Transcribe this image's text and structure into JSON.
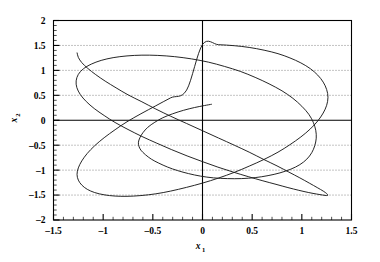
{
  "figure": {
    "background_color": "#ffffff",
    "frame_color": "#000000",
    "grid_color": "#555555",
    "curve_color": "#1a1a1a"
  },
  "axis_titles": {
    "x": "x",
    "x_sub": "1",
    "y": "x",
    "y_sub": "2"
  },
  "ticks": {
    "x_labels": [
      "-1.5",
      "-1",
      "-0.5",
      "0",
      "0.5",
      "1",
      "1.5"
    ],
    "y_labels": [
      "2",
      "1.5",
      "1",
      "0.5",
      "0",
      "-0.5",
      "-1",
      "-1.5",
      "-2"
    ]
  },
  "chart_data": {
    "type": "line",
    "title": "",
    "subtitle": "",
    "xlabel": "x1",
    "ylabel": "x2",
    "xlim": [
      -1.5,
      1.5
    ],
    "ylim": [
      -2,
      2
    ],
    "xticks": [
      -1.5,
      -1,
      -0.5,
      0,
      0.5,
      1,
      1.5
    ],
    "yticks": [
      -2,
      -1.5,
      -1,
      -0.5,
      0,
      0.5,
      1,
      1.5,
      2
    ],
    "x_minor_tick_step": 0.1,
    "y_minor_tick_step": 0.1,
    "grid": true,
    "grid_style": "dotted",
    "grid_axes": "y",
    "legend": null,
    "legend_position": "none",
    "annotations": [],
    "series": [
      {
        "name": "trajectory",
        "x": [
          0.09,
          0.02,
          -0.08,
          -0.19,
          -0.3,
          -0.4,
          -0.48,
          -0.55,
          -0.6,
          -0.63,
          -0.645,
          -0.64,
          -0.62,
          -0.575,
          -0.515,
          -0.44,
          -0.35,
          -0.25,
          -0.14,
          -0.02,
          0.11,
          0.25,
          0.39,
          0.53,
          0.66,
          0.78,
          0.89,
          0.98,
          1.05,
          1.1,
          1.13,
          1.145,
          1.14,
          1.115,
          1.07,
          1.0,
          0.91,
          0.8,
          0.67,
          0.53,
          0.38,
          0.22,
          0.06,
          -0.11,
          -0.28,
          -0.45,
          -0.61,
          -0.76,
          -0.9,
          -1.02,
          -1.12,
          -1.2,
          -1.25,
          -1.272,
          -1.265,
          -1.23,
          -1.17,
          -1.09,
          -0.99,
          -0.88,
          -0.75,
          -0.61,
          -0.46,
          -0.31,
          -0.155,
          0.0,
          0.155,
          0.31,
          0.46,
          0.6,
          0.74,
          0.86,
          0.97,
          1.07,
          1.15,
          1.21,
          1.25,
          1.262,
          1.25,
          1.215,
          1.155,
          1.075,
          0.98,
          0.87,
          0.75,
          0.61,
          0.47,
          0.32,
          0.16,
          0.0,
          -0.16,
          -0.32,
          -0.47,
          -0.61,
          -0.75,
          -0.87,
          -0.98,
          -1.075,
          -1.155,
          -1.215,
          -1.25,
          -1.262
        ],
        "y": [
          0.32,
          0.295,
          0.255,
          0.2,
          0.13,
          0.05,
          -0.04,
          -0.14,
          -0.25,
          -0.35,
          -0.44,
          -0.52,
          -0.6,
          -0.69,
          -0.78,
          -0.86,
          -0.94,
          -1.01,
          -1.07,
          -1.12,
          -1.155,
          -1.17,
          -1.17,
          -1.15,
          -1.11,
          -1.055,
          -0.98,
          -0.89,
          -0.78,
          -0.65,
          -0.51,
          -0.36,
          -0.2,
          -0.04,
          0.12,
          0.28,
          0.44,
          0.59,
          0.73,
          0.86,
          0.98,
          1.08,
          1.165,
          1.23,
          1.275,
          1.3,
          1.305,
          1.29,
          1.255,
          1.2,
          1.125,
          1.03,
          0.92,
          0.79,
          0.655,
          0.515,
          0.375,
          0.235,
          0.095,
          -0.045,
          -0.185,
          -0.325,
          -0.46,
          -0.59,
          -0.715,
          -0.83,
          -0.94,
          -1.04,
          -1.13,
          -1.21,
          -1.285,
          -1.35,
          -1.405,
          -1.45,
          -1.48,
          -1.5,
          -1.51,
          -1.5,
          -1.47,
          -1.42,
          -1.35,
          -1.26,
          -1.155,
          -1.04,
          -0.915,
          -0.78,
          -0.64,
          -0.5,
          -0.355,
          -0.21,
          -0.065,
          0.08,
          0.225,
          0.37,
          0.51,
          0.65,
          0.785,
          0.915,
          1.04,
          1.155,
          1.26,
          1.35
        ]
      },
      {
        "name": "limit-cycle-closed-orbit",
        "closed": true,
        "x": [
          0.0,
          0.16,
          0.32,
          0.47,
          0.62,
          0.76,
          0.88,
          0.99,
          1.085,
          1.16,
          1.215,
          1.25,
          1.263,
          1.25,
          1.215,
          1.16,
          1.085,
          0.99,
          0.88,
          0.76,
          0.62,
          0.47,
          0.32,
          0.16,
          0.0,
          -0.16,
          -0.32,
          -0.47,
          -0.62,
          -0.76,
          -0.88,
          -0.99,
          -1.085,
          -1.16,
          -1.215,
          -1.25,
          -1.263,
          -1.25,
          -1.215,
          -1.16,
          -1.085,
          -0.99,
          -0.88,
          -0.76,
          -0.62,
          -0.47,
          -0.32,
          -0.16
        ],
        "y": [
          1.52,
          1.515,
          1.495,
          1.46,
          1.405,
          1.335,
          1.25,
          1.15,
          1.035,
          0.905,
          0.765,
          0.615,
          0.46,
          0.3,
          0.145,
          -0.015,
          -0.175,
          -0.335,
          -0.49,
          -0.64,
          -0.785,
          -0.92,
          -1.045,
          -1.16,
          -1.26,
          -1.345,
          -1.42,
          -1.475,
          -1.51,
          -1.525,
          -1.52,
          -1.495,
          -1.45,
          -1.385,
          -1.3,
          -1.2,
          -1.085,
          -0.955,
          -0.815,
          -0.665,
          -0.51,
          -0.35,
          -0.19,
          -0.03,
          0.13,
          0.29,
          0.45,
          0.605
        ]
      }
    ]
  }
}
